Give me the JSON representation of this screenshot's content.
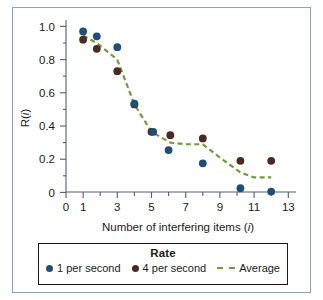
{
  "figure": {
    "border_color": "#8ba2b8",
    "background": "#ffffff"
  },
  "legend": {
    "title": "Rate",
    "entries": [
      {
        "label": "1 per second",
        "marker": "filled-circle-icon",
        "color": "#1f4e79"
      },
      {
        "label": "4 per second",
        "marker": "filled-circle-icon",
        "color": "#4a2b20"
      },
      {
        "label": "Average",
        "marker": "dashed-line-icon",
        "color": "#6f9c3e"
      }
    ]
  },
  "axes": {
    "x_title_main": "Number of interfering items (",
    "x_title_var": "i",
    "x_title_close": ")",
    "y_title_main": "R(",
    "y_title_var": "i",
    "y_title_close": ")",
    "x_tick_labels": [
      "0",
      "1",
      "3",
      "5",
      "7",
      "9",
      "11",
      "13"
    ],
    "y_tick_labels": [
      "1.0",
      "0.8",
      "0.6",
      "0.4",
      "0.2",
      "0"
    ]
  },
  "chart_data": {
    "type": "scatter",
    "title": "",
    "xlabel": "Number of interfering items (i)",
    "ylabel": "R(i)",
    "xlim": [
      0,
      13.6
    ],
    "ylim": [
      -0.04,
      1.04
    ],
    "xticks": [
      0,
      1,
      2,
      3,
      4,
      5,
      6,
      7,
      8,
      9,
      10,
      11,
      12,
      13
    ],
    "xtick_labels": [
      "0",
      "1",
      "",
      "3",
      "",
      "5",
      "",
      "7",
      "",
      "9",
      "",
      "11",
      "",
      "13"
    ],
    "yticks": [
      0,
      0.1,
      0.2,
      0.3,
      0.4,
      0.5,
      0.6,
      0.7,
      0.8,
      0.9,
      1.0
    ],
    "ytick_labels": [
      "0",
      "",
      "0.2",
      "",
      "0.4",
      "",
      "0.6",
      "",
      "0.8",
      "",
      "1.0"
    ],
    "grid": false,
    "legend_position": "below-axes",
    "legend_title": "Rate",
    "series": [
      {
        "name": "1 per second",
        "type": "scatter",
        "color": "#1f4e79",
        "marker": "o",
        "x": [
          1,
          1.8,
          3,
          4,
          5.1,
          6,
          8,
          10.2,
          12
        ],
        "y": [
          0.97,
          0.94,
          0.875,
          0.535,
          0.365,
          0.255,
          0.175,
          0.025,
          0.005
        ]
      },
      {
        "name": "4 per second",
        "type": "scatter",
        "color": "#4a2b20",
        "marker": "o",
        "x": [
          1,
          1.8,
          3,
          4,
          5,
          6.1,
          8,
          10.2,
          12
        ],
        "y": [
          0.92,
          0.865,
          0.73,
          0.53,
          0.365,
          0.345,
          0.325,
          0.19,
          0.19
        ]
      },
      {
        "name": "Average",
        "type": "line",
        "style": "dashed",
        "color": "#6f9c3e",
        "x": [
          1,
          1.8,
          3,
          4,
          5,
          6.1,
          7,
          8,
          9,
          10.2,
          11,
          12
        ],
        "y": [
          0.945,
          0.9,
          0.8,
          0.53,
          0.365,
          0.3,
          0.29,
          0.29,
          0.21,
          0.12,
          0.09,
          0.09
        ]
      }
    ]
  }
}
